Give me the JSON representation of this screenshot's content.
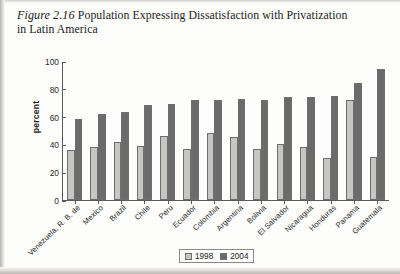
{
  "caption": {
    "figure_number": "Figure 2.16",
    "text": "Population Expressing Dissatisfaction with Privatization in Latin America"
  },
  "legend": {
    "items": [
      {
        "label": "1998",
        "color": "#c6c6c2"
      },
      {
        "label": "2004",
        "color": "#6b6b6b"
      }
    ]
  },
  "axis": {
    "y_label": "percent",
    "y_ticks": [
      "0",
      "20",
      "40",
      "60",
      "80",
      "100"
    ]
  },
  "chart_data": {
    "type": "bar",
    "title": "Population Expressing Dissatisfaction with Privatization in Latin America",
    "xlabel": "",
    "ylabel": "percent",
    "ylim": [
      0,
      100
    ],
    "ytick_step": 20,
    "grid": false,
    "legend_position": "bottom-center",
    "categories": [
      "Venezuela, R. B. de",
      "Mexico",
      "Brazil",
      "Chile",
      "Peru",
      "Ecuador",
      "Colombia",
      "Argentina",
      "Bolivia",
      "El Salvador",
      "Nicaragua",
      "Honduras",
      "Panama",
      "Guatemala"
    ],
    "series": [
      {
        "name": "1998",
        "color": "#c6c6c2",
        "values": [
          36,
          38,
          42,
          39,
          46,
          37,
          48,
          45,
          37,
          40,
          38,
          30,
          72,
          31
        ]
      },
      {
        "name": "2004",
        "color": "#6b6b6b",
        "values": [
          58,
          62,
          63,
          68,
          69,
          72,
          72,
          73,
          72,
          74,
          74,
          75,
          84,
          94
        ]
      }
    ]
  }
}
